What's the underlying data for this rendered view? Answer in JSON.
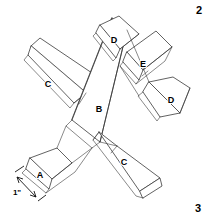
{
  "figure": {
    "page_number_top": "2",
    "page_number_bottom": "3",
    "dimension": {
      "label": "1\"",
      "description": "overall width callout at nose end of part A"
    },
    "part_labels": [
      {
        "id": "wing-left",
        "text": "C",
        "x": 48,
        "y": 85
      },
      {
        "id": "fuselage",
        "text": "B",
        "x": 99,
        "y": 110
      },
      {
        "id": "wing-right",
        "text": "C",
        "x": 124,
        "y": 163
      },
      {
        "id": "tail-upper",
        "text": "D",
        "x": 114,
        "y": 41
      },
      {
        "id": "tail-lower",
        "text": "D",
        "x": 171,
        "y": 101
      },
      {
        "id": "canopy",
        "text": "E",
        "x": 143,
        "y": 65
      },
      {
        "id": "nose",
        "text": "A",
        "x": 40,
        "y": 176
      }
    ],
    "colors": {
      "line": "#3a3a3a",
      "dimension_line": "#111111",
      "text": "#000000",
      "background": "#ffffff"
    }
  }
}
